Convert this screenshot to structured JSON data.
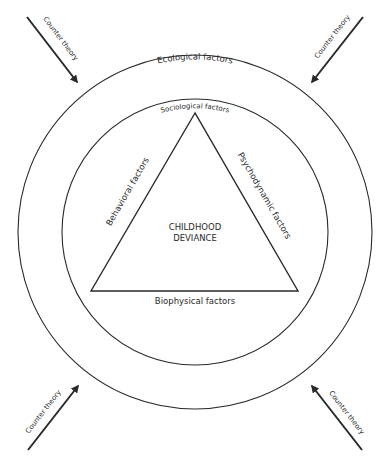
{
  "diagram": {
    "outer_ring_label": "Ecological factors",
    "inner_ring_label": "Sociological factors",
    "triangle": {
      "left_side": "Behavioral factors",
      "right_side": "Psychodynamic factors",
      "bottom_side": "Biophysical factors",
      "center_line1": "CHILDHOOD",
      "center_line2": "DEVIANCE"
    },
    "arrows": [
      {
        "position": "top-left",
        "label": "Counter theory"
      },
      {
        "position": "top-right",
        "label": "Counter theory"
      },
      {
        "position": "bottom-left",
        "label": "Counter theory"
      },
      {
        "position": "bottom-right",
        "label": "Counter theory"
      }
    ],
    "colors": {
      "stroke": "#2a2a2a",
      "background": "#ffffff"
    }
  }
}
